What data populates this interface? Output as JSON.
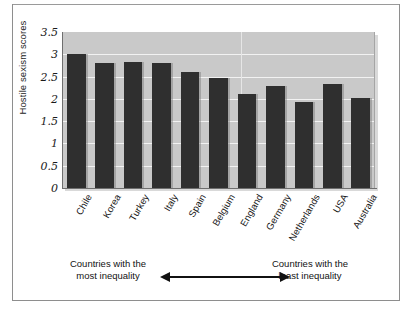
{
  "chart_data": {
    "type": "bar",
    "title": "",
    "xlabel": "",
    "ylabel": "Hostile sexism scores",
    "ylim": [
      0,
      3.5
    ],
    "yticks": [
      "0",
      "0.5",
      "1",
      "1.5",
      "2",
      "2.5",
      "3",
      "3.5"
    ],
    "grid": true,
    "legend": false,
    "categories": [
      "Chile",
      "Korea",
      "Turkey",
      "Italy",
      "Spain",
      "Belgium",
      "England",
      "Germany",
      "Netherlands",
      "USA",
      "Australia"
    ],
    "values": [
      3.0,
      2.8,
      2.83,
      2.8,
      2.6,
      2.48,
      2.1,
      2.3,
      1.93,
      2.33,
      2.03
    ],
    "bar_color": "#2f2f2f",
    "plot_background": "#c9c9c9",
    "gridline_color": "#f2f2f2",
    "annotations": {
      "left_caption_line1": "Countries with the",
      "left_caption_line2": "most inequality",
      "right_caption_line1": "Countries with the",
      "right_caption_line2": "least inequality",
      "arrow": "double-headed-horizontal-arrow"
    }
  }
}
